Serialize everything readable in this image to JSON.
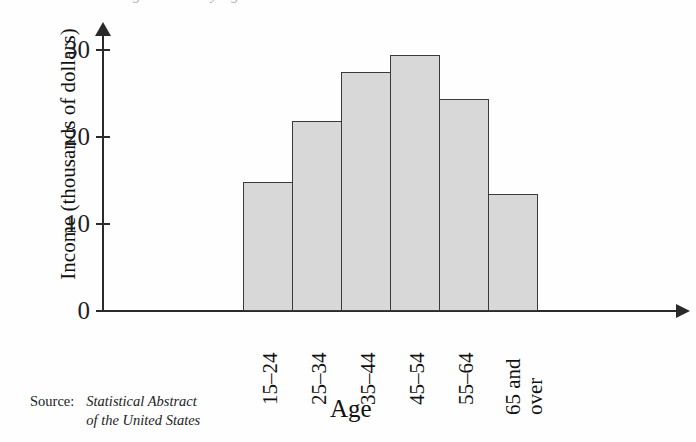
{
  "figure": {
    "clipped_title_remnant": "Average Income by Age",
    "background_color": "#fefefe"
  },
  "axis": {
    "y_title": "Income (thousands of dollars)",
    "x_title": "Age",
    "y_ticks": [
      "0",
      "10",
      "20",
      "30"
    ],
    "axis_color": "#2a2a2a"
  },
  "source": {
    "label": "Source:",
    "line1": "Statistical Abstract",
    "line2": "of the United States"
  },
  "colors": {
    "bar_fill": "#d8d8d8",
    "bar_edge": "#3a3a3a",
    "text": "#111111"
  },
  "chart_data": {
    "type": "bar",
    "title": "Average Income by Age",
    "xlabel": "Age",
    "ylabel": "Income (thousands of dollars)",
    "categories": [
      "15–24",
      "25–34",
      "35–44",
      "45–54",
      "55–64",
      "65 and over"
    ],
    "category_lines": [
      [
        "15–24"
      ],
      [
        "25–34"
      ],
      [
        "35–44"
      ],
      [
        "45–54"
      ],
      [
        "55–64"
      ],
      [
        "65 and",
        "over"
      ]
    ],
    "values": [
      14.8,
      21.8,
      27.5,
      29.4,
      24.4,
      13.4
    ],
    "ylim": [
      0,
      32
    ],
    "yticks": [
      0,
      10,
      20,
      30
    ],
    "grid": false,
    "legend": false,
    "source": "Statistical Abstract of the United States"
  }
}
